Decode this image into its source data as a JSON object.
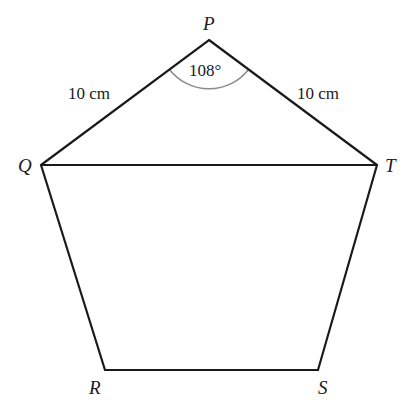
{
  "diagram": {
    "vertices": {
      "P": {
        "label": "P"
      },
      "Q": {
        "label": "Q"
      },
      "R": {
        "label": "R"
      },
      "S": {
        "label": "S"
      },
      "T": {
        "label": "T"
      }
    },
    "side_labels": {
      "PQ": "10 cm",
      "PT": "10 cm"
    },
    "angle_label": "108°",
    "colors": {
      "line": "#1a1a1a",
      "arc": "#8a8a8a"
    }
  }
}
